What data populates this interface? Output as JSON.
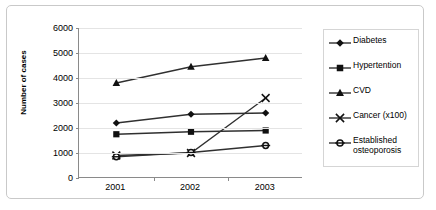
{
  "chart_data": {
    "type": "line",
    "title": "",
    "xlabel": "",
    "ylabel": "Number of cases",
    "categories": [
      "2001",
      "2002",
      "2003"
    ],
    "ylim": [
      0,
      6000
    ],
    "yticks": [
      0,
      1000,
      2000,
      3000,
      4000,
      5000,
      6000
    ],
    "grid": true,
    "legend_position": "right",
    "series": [
      {
        "name": "Diabetes",
        "marker": "diamond",
        "values": [
          2200,
          2550,
          2600
        ]
      },
      {
        "name": "Hypertention",
        "marker": "square",
        "values": [
          1750,
          1850,
          1900
        ]
      },
      {
        "name": "CVD",
        "marker": "triangle",
        "values": [
          3800,
          4450,
          4800
        ]
      },
      {
        "name": "Cancer (x100)",
        "marker": "x",
        "values": [
          900,
          1000,
          3200
        ]
      },
      {
        "name": "Established osteoporosis",
        "marker": "circle-dash",
        "values": [
          850,
          1020,
          1300
        ]
      }
    ]
  },
  "legend": {
    "items": [
      {
        "label": "Diabetes"
      },
      {
        "label": "Hypertention"
      },
      {
        "label": "CVD"
      },
      {
        "label": "Cancer (x100)"
      },
      {
        "label": "Established osteoporosis"
      }
    ]
  },
  "colors": {
    "line": "#303030",
    "marker": "#111111",
    "grid": "#e4e4e4",
    "axis": "#8a8a8a",
    "border": "#c9c9c9",
    "text": "#000000"
  }
}
